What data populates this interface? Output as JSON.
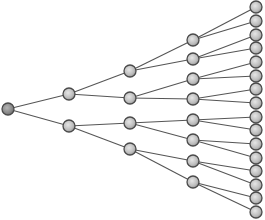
{
  "diagram": {
    "type": "binary-tree",
    "orientation": "left-to-right",
    "levels": 5,
    "node_radius": 6,
    "colors": {
      "background": "#ffffff",
      "edge": "#555555",
      "node_stroke": "#4a4a4a",
      "node_fill_light": "#e6e6e6",
      "node_fill_dark": "#9a9a9a",
      "root_fill_dark": "#6e6e6e"
    },
    "nodes": [
      {
        "id": "n0",
        "level": 0,
        "x": 8,
        "y": 109
      },
      {
        "id": "n1",
        "level": 1,
        "x": 69,
        "y": 94
      },
      {
        "id": "n2",
        "level": 1,
        "x": 69,
        "y": 126
      },
      {
        "id": "n3",
        "level": 2,
        "x": 130,
        "y": 71
      },
      {
        "id": "n4",
        "level": 2,
        "x": 130,
        "y": 98
      },
      {
        "id": "n5",
        "level": 2,
        "x": 130,
        "y": 123
      },
      {
        "id": "n6",
        "level": 2,
        "x": 130,
        "y": 149
      },
      {
        "id": "n7",
        "level": 3,
        "x": 193,
        "y": 40
      },
      {
        "id": "n8",
        "level": 3,
        "x": 193,
        "y": 59
      },
      {
        "id": "n9",
        "level": 3,
        "x": 193,
        "y": 79
      },
      {
        "id": "n10",
        "level": 3,
        "x": 193,
        "y": 99
      },
      {
        "id": "n11",
        "level": 3,
        "x": 193,
        "y": 120
      },
      {
        "id": "n12",
        "level": 3,
        "x": 193,
        "y": 140
      },
      {
        "id": "n13",
        "level": 3,
        "x": 193,
        "y": 161
      },
      {
        "id": "n14",
        "level": 3,
        "x": 193,
        "y": 182
      },
      {
        "id": "n15",
        "level": 4,
        "x": 256,
        "y": 7
      },
      {
        "id": "n16",
        "level": 4,
        "x": 256,
        "y": 21
      },
      {
        "id": "n17",
        "level": 4,
        "x": 256,
        "y": 35
      },
      {
        "id": "n18",
        "level": 4,
        "x": 256,
        "y": 48
      },
      {
        "id": "n19",
        "level": 4,
        "x": 256,
        "y": 62
      },
      {
        "id": "n20",
        "level": 4,
        "x": 256,
        "y": 76
      },
      {
        "id": "n21",
        "level": 4,
        "x": 256,
        "y": 89
      },
      {
        "id": "n22",
        "level": 4,
        "x": 256,
        "y": 103
      },
      {
        "id": "n23",
        "level": 4,
        "x": 256,
        "y": 117
      },
      {
        "id": "n24",
        "level": 4,
        "x": 256,
        "y": 130
      },
      {
        "id": "n25",
        "level": 4,
        "x": 256,
        "y": 144
      },
      {
        "id": "n26",
        "level": 4,
        "x": 256,
        "y": 158
      },
      {
        "id": "n27",
        "level": 4,
        "x": 256,
        "y": 171
      },
      {
        "id": "n28",
        "level": 4,
        "x": 256,
        "y": 185
      },
      {
        "id": "n29",
        "level": 4,
        "x": 256,
        "y": 198
      },
      {
        "id": "n30",
        "level": 4,
        "x": 256,
        "y": 212
      }
    ],
    "edges": [
      [
        "n0",
        "n1"
      ],
      [
        "n0",
        "n2"
      ],
      [
        "n1",
        "n3"
      ],
      [
        "n1",
        "n4"
      ],
      [
        "n2",
        "n5"
      ],
      [
        "n2",
        "n6"
      ],
      [
        "n3",
        "n7"
      ],
      [
        "n3",
        "n8"
      ],
      [
        "n4",
        "n9"
      ],
      [
        "n4",
        "n10"
      ],
      [
        "n5",
        "n11"
      ],
      [
        "n5",
        "n12"
      ],
      [
        "n6",
        "n13"
      ],
      [
        "n6",
        "n14"
      ],
      [
        "n7",
        "n15"
      ],
      [
        "n7",
        "n16"
      ],
      [
        "n8",
        "n17"
      ],
      [
        "n8",
        "n18"
      ],
      [
        "n9",
        "n19"
      ],
      [
        "n9",
        "n20"
      ],
      [
        "n10",
        "n21"
      ],
      [
        "n10",
        "n22"
      ],
      [
        "n11",
        "n23"
      ],
      [
        "n11",
        "n24"
      ],
      [
        "n12",
        "n25"
      ],
      [
        "n12",
        "n26"
      ],
      [
        "n13",
        "n27"
      ],
      [
        "n13",
        "n28"
      ],
      [
        "n14",
        "n29"
      ],
      [
        "n14",
        "n30"
      ]
    ]
  }
}
